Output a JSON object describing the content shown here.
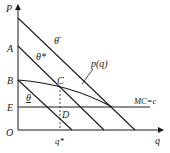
{
  "diagram": {
    "axes": {
      "y_label": "P",
      "x_label": "q",
      "origin_label": "O"
    },
    "y_axis_points": {
      "A": "A",
      "B": "B",
      "E": "E"
    },
    "points": {
      "C": "C",
      "D": "D"
    },
    "x_axis_marks": {
      "q_star": "q*"
    },
    "lines": {
      "theta_bar": "θ̄",
      "theta_star": "θ*",
      "theta": "θ",
      "price_curve": "p(q)",
      "marginal_cost": "MC=c"
    },
    "colors": {
      "line": "#1a1a1a",
      "background": "#ffffff"
    }
  }
}
